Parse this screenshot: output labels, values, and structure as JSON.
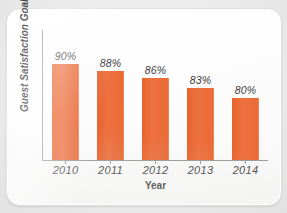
{
  "chart_data": {
    "type": "bar",
    "title": "",
    "xlabel": "Year",
    "ylabel": "Guest Satisfaction Goal",
    "categories": [
      "2010",
      "2011",
      "2012",
      "2013",
      "2014"
    ],
    "values": [
      90,
      88,
      86,
      83,
      80
    ],
    "value_labels": [
      "90%",
      "88%",
      "86%",
      "83%",
      "80%"
    ],
    "ylim": [
      0,
      100
    ],
    "grid": false,
    "legend": "none",
    "series": [
      {
        "name": "Guest Satisfaction Goal",
        "values": [
          90,
          88,
          86,
          83,
          80
        ],
        "color": "#e96a35"
      }
    ]
  },
  "colors": {
    "bar": "#e96a35",
    "axis": "#9a9a9a",
    "text": "#4a4a4a",
    "card": "#ffffff",
    "background": "#ececec"
  }
}
